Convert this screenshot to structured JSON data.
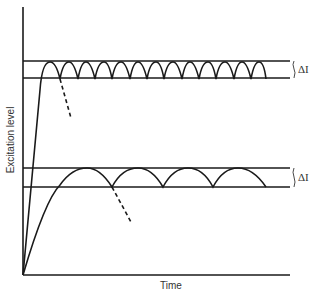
{
  "diagram": {
    "axes": {
      "ylabel": "Excitation level",
      "xlabel": "Time"
    },
    "bands": [
      {
        "name": "upper",
        "label": "ΔI"
      },
      {
        "name": "lower",
        "label": "ΔI"
      }
    ],
    "colors": {
      "line": "#1a1a1a",
      "text": "#333333",
      "background": "#ffffff"
    }
  }
}
